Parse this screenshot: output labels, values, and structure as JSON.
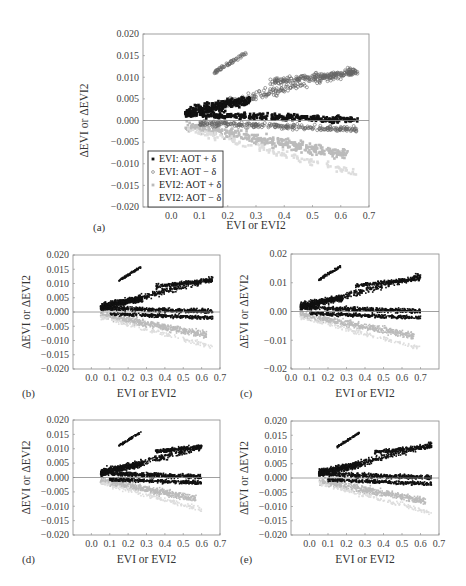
{
  "colors": {
    "evi_aot_plus": "#111111",
    "evi_aot_minus": "#666666",
    "evi2_aot_plus": "#bbbbbb",
    "evi2_aot_minus": "#dddddd",
    "axis": "#888888",
    "zero_line": "#888888"
  },
  "chart_data": [
    {
      "panel": "(a)",
      "type": "scatter",
      "xlabel": "EVI or EVI2",
      "ylabel": "ΔEVI or ΔEVI2",
      "xlim": [
        -0.1,
        0.7
      ],
      "ylim": [
        -0.02,
        0.02
      ],
      "xticks": [
        "0.0",
        "0.1",
        "0.2",
        "0.3",
        "0.4",
        "0.5",
        "0.6",
        "0.7"
      ],
      "yticks": [
        "0.020",
        "0.015",
        "0.010",
        "0.005",
        "0.000",
        "−0.005",
        "−0.010",
        "−0.015",
        "−0.020"
      ],
      "grid": false,
      "zero_line": true,
      "legend_position": "lower left",
      "legend": [
        "EVI: AOT + δ",
        "EVI: AOT − δ",
        "EVI2: AOT + δ",
        "EVI2: AOT − δ"
      ],
      "series": [
        {
          "name": "EVI: AOT + δ",
          "marker": "filled-square",
          "trend": [
            [
              0.05,
              0.002
            ],
            [
              0.2,
              0.003
            ],
            [
              0.4,
              0.001
            ],
            [
              0.6,
              0.0005
            ],
            [
              0.65,
              0.0
            ]
          ]
        },
        {
          "name": "EVI: AOT − δ",
          "marker": "open-circle",
          "trend": [
            [
              0.05,
              0.001
            ],
            [
              0.2,
              0.006
            ],
            [
              0.3,
              0.007
            ],
            [
              0.45,
              0.01
            ],
            [
              0.65,
              0.011
            ],
            [
              0.15,
              0.012
            ],
            [
              0.27,
              0.016
            ]
          ]
        },
        {
          "name": "EVI2: AOT + δ",
          "marker": "light-square",
          "trend": [
            [
              0.05,
              -0.001
            ],
            [
              0.2,
              -0.003
            ],
            [
              0.4,
              -0.006
            ],
            [
              0.6,
              -0.009
            ]
          ]
        },
        {
          "name": "EVI2: AOT − δ",
          "marker": "light-dot",
          "trend": [
            [
              0.05,
              0.0
            ],
            [
              0.3,
              0.004
            ],
            [
              0.6,
              0.007
            ]
          ]
        }
      ]
    },
    {
      "panel": "(b)",
      "type": "scatter",
      "xlabel": "EVI or EVI2",
      "ylabel": "ΔEVI or ΔEVI2",
      "xlim": [
        -0.1,
        0.7
      ],
      "ylim": [
        -0.02,
        0.02
      ],
      "xticks": [
        "0.0",
        "0.1",
        "0.2",
        "0.3",
        "0.4",
        "0.5",
        "0.6",
        "0.7"
      ],
      "yticks": [
        "0.020",
        "0.015",
        "0.010",
        "0.005",
        "0.000",
        "−0.005",
        "−0.010",
        "−0.015",
        "−0.020"
      ],
      "zero_line": true
    },
    {
      "panel": "(c)",
      "type": "scatter",
      "xlabel": "EVI or EVI2",
      "ylabel": "ΔEVI or ΔEVI2",
      "xlim": [
        0.0,
        0.8
      ],
      "ylim": [
        -0.02,
        0.02
      ],
      "xticks": [
        "0.0",
        "0.1",
        "0.2",
        "0.3",
        "0.4",
        "0.5",
        "0.6",
        "0.7"
      ],
      "yticks": [
        "0.02",
        "0.01",
        "0.00",
        "−0.01",
        "−0.02"
      ],
      "zero_line": true
    },
    {
      "panel": "(d)",
      "type": "scatter",
      "xlabel": "EVI or EVI2",
      "ylabel": "ΔEVI or ΔEVI2",
      "xlim": [
        -0.1,
        0.7
      ],
      "ylim": [
        -0.02,
        0.02
      ],
      "xticks": [
        "0.0",
        "0.1",
        "0.2",
        "0.3",
        "0.4",
        "0.5",
        "0.6",
        "0.7"
      ],
      "yticks": [
        "0.020",
        "0.015",
        "0.010",
        "0.005",
        "0.000",
        "−0.005",
        "−0.010",
        "−0.015",
        "−0.020"
      ],
      "zero_line": true
    },
    {
      "panel": "(e)",
      "type": "scatter",
      "xlabel": "EVI or EVI2",
      "ylabel": "ΔEVI or ΔEVI2",
      "xlim": [
        -0.1,
        0.7
      ],
      "ylim": [
        -0.02,
        0.02
      ],
      "xticks": [
        "0.0",
        "0.1",
        "0.2",
        "0.3",
        "0.4",
        "0.5",
        "0.6",
        "0.7"
      ],
      "yticks": [
        "0.020",
        "0.015",
        "0.010",
        "0.005",
        "0.000",
        "−0.005",
        "−0.010",
        "−0.015",
        "−0.020"
      ],
      "zero_line": true
    }
  ],
  "layout": {
    "panels": [
      {
        "x0": 143,
        "y0": 34,
        "x1": 369,
        "y1": 207,
        "letter_x": 93,
        "letter_y": 231,
        "xlabel_y": 229,
        "ylabel_x": 88
      },
      {
        "x0": 73,
        "y0": 255,
        "x1": 220,
        "y1": 369,
        "letter_x": 22,
        "letter_y": 397,
        "xlabel_y": 397,
        "ylabel_x": 30
      },
      {
        "x0": 291,
        "y0": 254,
        "x1": 439,
        "y1": 369,
        "letter_x": 240,
        "letter_y": 397,
        "xlabel_y": 397,
        "ylabel_x": 248
      },
      {
        "x0": 73,
        "y0": 420,
        "x1": 220,
        "y1": 535,
        "letter_x": 22,
        "letter_y": 563,
        "xlabel_y": 563,
        "ylabel_x": 30
      },
      {
        "x0": 291,
        "y0": 421,
        "x1": 439,
        "y1": 535,
        "letter_x": 240,
        "letter_y": 563,
        "xlabel_y": 563,
        "ylabel_x": 248
      }
    ]
  }
}
